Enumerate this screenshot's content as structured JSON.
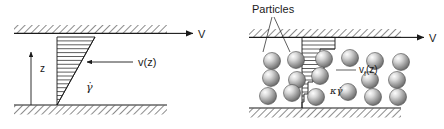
{
  "figure": {
    "background_color": "#ffffff",
    "line_color": "#1a1a1a",
    "particle_color_light": "#f2f2f2",
    "particle_color_mid": "#b8b8b8",
    "particle_color_dark": "#6e6e6e"
  },
  "panels": [
    {
      "id": "left",
      "name": "pure-fluid-panel",
      "labels": {
        "wall_velocity": "V",
        "vertical_axis": "z",
        "velocity_profile": "v(z)",
        "shear_rate": "γ̇"
      },
      "geometry": {
        "top_plate_y": 33,
        "bottom_plate_y": 105,
        "gap_height": 72,
        "profile_apex_x": 57,
        "profile_top_x": 95,
        "profile_line_count": 17
      },
      "profile": {
        "type": "linear",
        "description": "Linear velocity profile, zero at bottom plate, maximum V at top plate",
        "points": [
          {
            "z": 0,
            "v": 0
          },
          {
            "z": 1,
            "v": 1
          }
        ]
      }
    },
    {
      "id": "right",
      "name": "suspension-panel",
      "labels": {
        "wall_velocity": "V",
        "callout": "Particles",
        "velocity_profile": "v",
        "velocity_profile_sub": "f",
        "velocity_profile_arg": "(z)",
        "shear_rate": "κγ̇"
      },
      "geometry": {
        "top_plate_y": 37,
        "bottom_plate_y": 108,
        "gap_height": 71,
        "profile_base_x": 302,
        "profile_max_x": 335,
        "particle_radius": 8.5,
        "particle_count": 21
      },
      "profile": {
        "type": "stepped",
        "description": "Stepped / plug-like velocity profile perturbed by suspended particles",
        "steps": [
          {
            "z": 1.0,
            "v": 1.0
          },
          {
            "z": 0.84,
            "v": 0.92
          },
          {
            "z": 0.7,
            "v": 0.6
          },
          {
            "z": 0.52,
            "v": 0.66
          },
          {
            "z": 0.38,
            "v": 0.4
          },
          {
            "z": 0.2,
            "v": 0.3
          },
          {
            "z": 0.07,
            "v": 0.16
          },
          {
            "z": 0.0,
            "v": 0.0
          }
        ]
      },
      "particles": [
        {
          "cx": 272,
          "cy": 61
        },
        {
          "cx": 296,
          "cy": 60
        },
        {
          "cx": 324,
          "cy": 59
        },
        {
          "cx": 350,
          "cy": 58
        },
        {
          "cx": 375,
          "cy": 61
        },
        {
          "cx": 401,
          "cy": 62
        },
        {
          "cx": 271,
          "cy": 78
        },
        {
          "cx": 297,
          "cy": 80
        },
        {
          "cx": 320,
          "cy": 76
        },
        {
          "cx": 370,
          "cy": 80
        },
        {
          "cx": 397,
          "cy": 80
        },
        {
          "cx": 268,
          "cy": 96
        },
        {
          "cx": 292,
          "cy": 93
        },
        {
          "cx": 316,
          "cy": 97
        },
        {
          "cx": 348,
          "cy": 92
        },
        {
          "cx": 373,
          "cy": 97
        },
        {
          "cx": 398,
          "cy": 97
        }
      ]
    }
  ]
}
